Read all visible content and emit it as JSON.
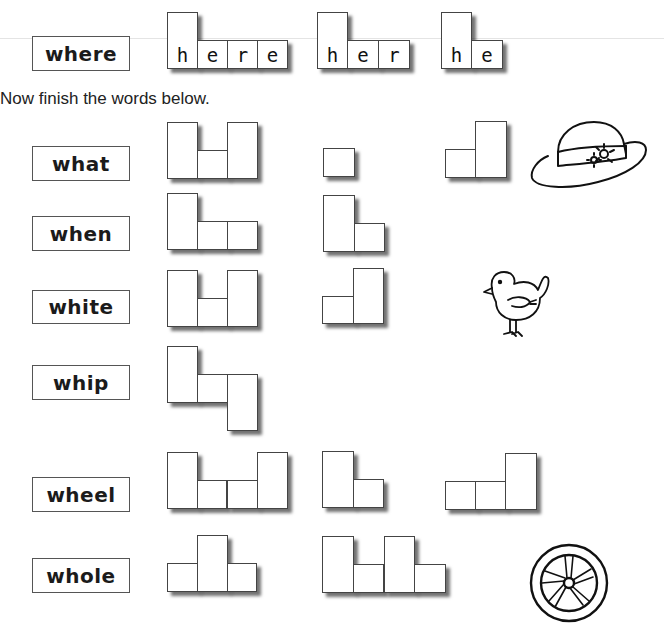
{
  "example": {
    "word": "where",
    "label_box": {
      "x": 32,
      "y": 36,
      "w": 98,
      "h": 35
    },
    "shapes": [
      {
        "name": "shape-here",
        "cells": [
          {
            "x": 167,
            "y": 12,
            "w": 31,
            "h": 57,
            "letter": "h"
          },
          {
            "x": 197,
            "y": 40,
            "w": 31,
            "h": 29,
            "letter": "e"
          },
          {
            "x": 227,
            "y": 40,
            "w": 31,
            "h": 29,
            "letter": "r"
          },
          {
            "x": 257,
            "y": 40,
            "w": 31,
            "h": 29,
            "letter": "e"
          }
        ]
      },
      {
        "name": "shape-her",
        "cells": [
          {
            "x": 317,
            "y": 12,
            "w": 31,
            "h": 57,
            "letter": "h"
          },
          {
            "x": 347,
            "y": 40,
            "w": 32,
            "h": 29,
            "letter": "e"
          },
          {
            "x": 378,
            "y": 40,
            "w": 32,
            "h": 29,
            "letter": "r"
          }
        ]
      },
      {
        "name": "shape-he",
        "cells": [
          {
            "x": 441,
            "y": 12,
            "w": 31,
            "h": 57,
            "letter": "h"
          },
          {
            "x": 471,
            "y": 40,
            "w": 32,
            "h": 29,
            "letter": "e"
          }
        ]
      }
    ]
  },
  "instruction": "Now finish the words below.",
  "rows": [
    {
      "word": "what",
      "label_box": {
        "x": 32,
        "y": 146,
        "w": 98,
        "h": 35
      },
      "shapes": [
        {
          "name": "shape-what",
          "cells": [
            {
              "x": 167,
              "y": 122,
              "w": 31,
              "h": 57,
              "letter": ""
            },
            {
              "x": 197,
              "y": 150,
              "w": 31,
              "h": 29,
              "letter": ""
            },
            {
              "x": 227,
              "y": 122,
              "w": 31,
              "h": 57,
              "letter": ""
            }
          ]
        },
        {
          "name": "shape-hat",
          "cells": [
            {
              "x": 323,
              "y": 148,
              "w": 32,
              "h": 29,
              "letter": ""
            }
          ]
        },
        {
          "name": "shape-at",
          "cells": [
            {
              "x": 445,
              "y": 149,
              "w": 31,
              "h": 29,
              "letter": ""
            },
            {
              "x": 475,
              "y": 121,
              "w": 32,
              "h": 57,
              "letter": ""
            }
          ]
        }
      ],
      "picture": "hat-picture"
    },
    {
      "word": "when",
      "label_box": {
        "x": 32,
        "y": 216,
        "w": 98,
        "h": 35
      },
      "shapes": [
        {
          "name": "shape-when",
          "cells": [
            {
              "x": 167,
              "y": 193,
              "w": 31,
              "h": 57,
              "letter": ""
            },
            {
              "x": 197,
              "y": 221,
              "w": 31,
              "h": 29,
              "letter": ""
            },
            {
              "x": 227,
              "y": 221,
              "w": 31,
              "h": 29,
              "letter": ""
            }
          ]
        },
        {
          "name": "shape-hen",
          "cells": [
            {
              "x": 323,
              "y": 195,
              "w": 32,
              "h": 57,
              "letter": ""
            },
            {
              "x": 354,
              "y": 223,
              "w": 31,
              "h": 29,
              "letter": ""
            }
          ]
        }
      ]
    },
    {
      "word": "white",
      "label_box": {
        "x": 32,
        "y": 290,
        "w": 98,
        "h": 34
      },
      "shapes": [
        {
          "name": "shape-white",
          "cells": [
            {
              "x": 167,
              "y": 270,
              "w": 31,
              "h": 57,
              "letter": ""
            },
            {
              "x": 197,
              "y": 298,
              "w": 31,
              "h": 29,
              "letter": ""
            },
            {
              "x": 227,
              "y": 270,
              "w": 31,
              "h": 57,
              "letter": ""
            }
          ]
        },
        {
          "name": "shape-bite",
          "cells": [
            {
              "x": 322,
              "y": 296,
              "w": 32,
              "h": 28,
              "letter": ""
            },
            {
              "x": 353,
              "y": 268,
              "w": 31,
              "h": 56,
              "letter": ""
            }
          ]
        }
      ],
      "picture": "chick-picture"
    },
    {
      "word": "whip",
      "label_box": {
        "x": 32,
        "y": 365,
        "w": 98,
        "h": 35
      },
      "shapes": [
        {
          "name": "shape-whip",
          "cells": [
            {
              "x": 167,
              "y": 346,
              "w": 31,
              "h": 57,
              "letter": ""
            },
            {
              "x": 197,
              "y": 374,
              "w": 31,
              "h": 29,
              "letter": ""
            },
            {
              "x": 227,
              "y": 374,
              "w": 31,
              "h": 57,
              "letter": ""
            }
          ]
        }
      ]
    },
    {
      "word": "wheel",
      "label_box": {
        "x": 32,
        "y": 477,
        "w": 98,
        "h": 35
      },
      "shapes": [
        {
          "name": "shape-wheel",
          "cells": [
            {
              "x": 167,
              "y": 452,
              "w": 31,
              "h": 57,
              "letter": ""
            },
            {
              "x": 197,
              "y": 480,
              "w": 30,
              "h": 29,
              "letter": ""
            },
            {
              "x": 227,
              "y": 480,
              "w": 31,
              "h": 29,
              "letter": ""
            },
            {
              "x": 257,
              "y": 452,
              "w": 31,
              "h": 57,
              "letter": ""
            }
          ]
        },
        {
          "name": "shape-heel",
          "cells": [
            {
              "x": 322,
              "y": 451,
              "w": 32,
              "h": 57,
              "letter": ""
            },
            {
              "x": 353,
              "y": 479,
              "w": 31,
              "h": 29,
              "letter": ""
            }
          ]
        },
        {
          "name": "shape-eel",
          "cells": [
            {
              "x": 445,
              "y": 481,
              "w": 31,
              "h": 29,
              "letter": ""
            },
            {
              "x": 475,
              "y": 481,
              "w": 31,
              "h": 29,
              "letter": ""
            },
            {
              "x": 505,
              "y": 453,
              "w": 32,
              "h": 57,
              "letter": ""
            }
          ]
        }
      ]
    },
    {
      "word": "whole",
      "label_box": {
        "x": 32,
        "y": 558,
        "w": 98,
        "h": 35
      },
      "shapes": [
        {
          "name": "shape-whole",
          "cells": [
            {
              "x": 167,
              "y": 563,
              "w": 31,
              "h": 29,
              "letter": ""
            },
            {
              "x": 197,
              "y": 535,
              "w": 31,
              "h": 57,
              "letter": ""
            },
            {
              "x": 227,
              "y": 563,
              "w": 30,
              "h": 29,
              "letter": ""
            }
          ]
        },
        {
          "name": "shape-whole-2",
          "cells": [
            {
              "x": 322,
              "y": 536,
              "w": 32,
              "h": 57,
              "letter": ""
            },
            {
              "x": 353,
              "y": 564,
              "w": 31,
              "h": 29,
              "letter": ""
            },
            {
              "x": 384,
              "y": 536,
              "w": 31,
              "h": 57,
              "letter": ""
            },
            {
              "x": 414,
              "y": 564,
              "w": 32,
              "h": 29,
              "letter": ""
            }
          ]
        }
      ],
      "picture": "wheel-picture"
    }
  ],
  "pictures": {
    "hat": {
      "x": 528,
      "y": 118,
      "w": 122,
      "h": 74
    },
    "chick": {
      "x": 478,
      "y": 266,
      "w": 74,
      "h": 76
    },
    "wheel": {
      "x": 527,
      "y": 541,
      "w": 84,
      "h": 84
    }
  },
  "colors": {
    "border": "#444444",
    "shadow": "#555555",
    "background": "#ffffff",
    "ink": "#1a1a1a"
  }
}
